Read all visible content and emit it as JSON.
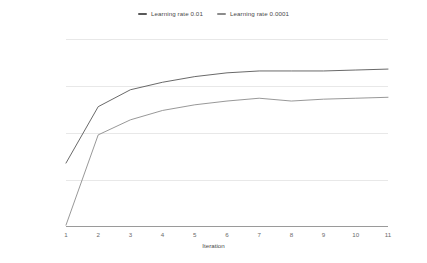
{
  "chart_data": {
    "type": "line",
    "title": "",
    "xlabel": "Iteration",
    "ylabel": "Accuracy",
    "x": [
      1,
      2,
      3,
      4,
      5,
      6,
      7,
      8,
      9,
      10,
      11
    ],
    "xlim": [
      1,
      11
    ],
    "ylim": [
      0,
      100
    ],
    "yticks": [
      0,
      25,
      50,
      75,
      100
    ],
    "xticks": [
      1,
      2,
      3,
      4,
      5,
      6,
      7,
      8,
      9,
      10,
      11
    ],
    "grid": true,
    "legend_position": "top-center",
    "series": [
      {
        "name": "Learning rate 0.01",
        "color": "#585858",
        "values": [
          34,
          64,
          73,
          77,
          80,
          82,
          83,
          83,
          83,
          83.5,
          84
        ]
      },
      {
        "name": "Learning rate 0.0001",
        "color": "#8c8c8c",
        "values": [
          1,
          49,
          57,
          62,
          65,
          67,
          68.5,
          67,
          68,
          68.5,
          69
        ]
      }
    ]
  },
  "legend": {
    "entries": [
      {
        "label": "Learning rate 0.01",
        "marker": "dash-marker"
      },
      {
        "label": "Learning rate 0.0001",
        "marker": "dash-marker"
      }
    ]
  },
  "axes": {
    "y": {
      "label": "Accuracy",
      "ticks": [
        "0",
        "25",
        "50",
        "75",
        "100"
      ]
    },
    "x": {
      "label": "Iteration",
      "ticks": [
        "1",
        "2",
        "3",
        "4",
        "5",
        "6",
        "7",
        "8",
        "9",
        "10",
        "11"
      ]
    }
  },
  "colors": {
    "grid": "#e8e8e8",
    "axis": "#9a9a9a",
    "text": "#6b6b6b",
    "series_1": "#585858",
    "series_2": "#8c8c8c"
  }
}
